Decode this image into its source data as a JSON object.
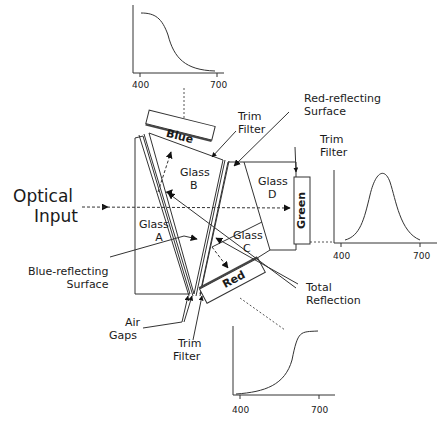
{
  "labels": {
    "optical_input_1": "Optical",
    "optical_input_2": "Input",
    "blue": "Blue",
    "red": "Red",
    "green": "Green",
    "glass_a_1": "Glass",
    "glass_a_2": "A",
    "glass_b_1": "Glass",
    "glass_b_2": "B",
    "glass_c_1": "Glass",
    "glass_c_2": "C",
    "glass_d_1": "Glass",
    "glass_d_2": "D",
    "trim_filter_top_1": "Trim",
    "trim_filter_top_2": "Filter",
    "trim_filter_right_1": "Trim",
    "trim_filter_right_2": "Filter",
    "trim_filter_bottom_1": "Trim",
    "trim_filter_bottom_2": "Filter",
    "red_reflecting_1": "Red-reflecting",
    "red_reflecting_2": "Surface",
    "blue_reflecting_1": "Blue-reflecting",
    "blue_reflecting_2": "Surface",
    "air_gaps_1": "Air",
    "air_gaps_2": "Gaps",
    "total_reflection_1": "Total",
    "total_reflection_2": "Reflection"
  },
  "charts": {
    "blue": {
      "tick_min": "400",
      "tick_max": "700"
    },
    "green": {
      "tick_min": "400",
      "tick_max": "700"
    },
    "red": {
      "tick_min": "400",
      "tick_max": "700"
    }
  }
}
